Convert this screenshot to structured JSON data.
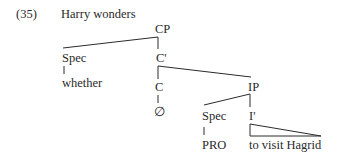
{
  "example": {
    "number": "(35)",
    "sentence": "Harry wonders"
  },
  "tree": {
    "root": "CP",
    "nodes": {
      "cp": "CP",
      "spec_cp": "Spec",
      "whether": "whether",
      "c_bar": "C'",
      "c": "C",
      "null": "∅",
      "ip": "IP",
      "spec_ip": "Spec",
      "pro": "PRO",
      "i_bar": "I'",
      "i_bar_content": "to visit Hagrid"
    },
    "structure": [
      {
        "parent": "CP",
        "children": [
          "Spec",
          "C'"
        ]
      },
      {
        "parent": "Spec (CP)",
        "children": [
          "whether"
        ]
      },
      {
        "parent": "C'",
        "children": [
          "C",
          "IP"
        ]
      },
      {
        "parent": "C",
        "children": [
          "∅"
        ]
      },
      {
        "parent": "IP",
        "children": [
          "Spec",
          "I'"
        ]
      },
      {
        "parent": "Spec (IP)",
        "children": [
          "PRO"
        ]
      },
      {
        "parent": "I'",
        "children": [
          "to visit Hagrid"
        ],
        "triangle": true
      }
    ]
  },
  "colors": {
    "text": "#2a2a2a",
    "background": "#ffffff"
  }
}
